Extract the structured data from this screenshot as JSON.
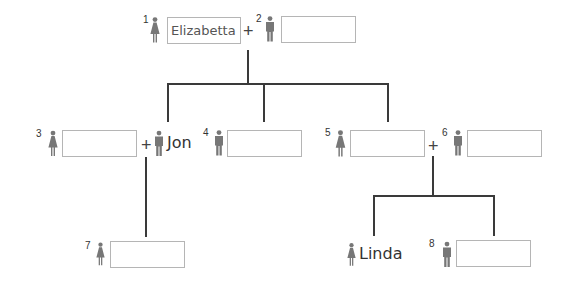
{
  "diagram": {
    "type": "family-tree",
    "connector_color": "#3a3a3a",
    "icon_color": "#777777",
    "box_border_color": "#b5b5b5"
  },
  "people": [
    {
      "id": 1,
      "number": "1",
      "gender": "female",
      "icon": "female-icon",
      "value": "Elizabetta",
      "mode": "box"
    },
    {
      "id": 2,
      "number": "2",
      "gender": "male",
      "icon": "male-icon",
      "value": "",
      "mode": "box"
    },
    {
      "id": 3,
      "number": "3",
      "gender": "female",
      "icon": "female-icon",
      "value": "",
      "mode": "box"
    },
    {
      "id": "jon",
      "number": "",
      "gender": "male",
      "icon": "male-icon",
      "value": "Jon",
      "mode": "label"
    },
    {
      "id": 4,
      "number": "4",
      "gender": "male",
      "icon": "male-icon",
      "value": "",
      "mode": "box"
    },
    {
      "id": 5,
      "number": "5",
      "gender": "female",
      "icon": "female-icon",
      "value": "",
      "mode": "box"
    },
    {
      "id": 6,
      "number": "6",
      "gender": "male",
      "icon": "male-icon",
      "value": "",
      "mode": "box"
    },
    {
      "id": 7,
      "number": "7",
      "gender": "female",
      "icon": "female-icon",
      "value": "",
      "mode": "box"
    },
    {
      "id": "linda",
      "number": "",
      "gender": "female",
      "icon": "female-icon",
      "value": "Linda",
      "mode": "label"
    },
    {
      "id": 8,
      "number": "8",
      "gender": "male",
      "icon": "male-icon",
      "value": "",
      "mode": "box"
    }
  ],
  "couples": [
    {
      "partners": [
        1,
        2
      ],
      "symbol": "+"
    },
    {
      "partners": [
        3,
        "jon"
      ],
      "symbol": "+"
    },
    {
      "partners": [
        5,
        6
      ],
      "symbol": "+"
    }
  ],
  "labels": {
    "p1_num": "1",
    "p1_value": "Elizabetta",
    "p2_num": "2",
    "p3_num": "3",
    "jon_name": "Jon",
    "p4_num": "4",
    "p5_num": "5",
    "p6_num": "6",
    "p7_num": "7",
    "linda_name": "Linda",
    "p8_num": "8",
    "plus": "+"
  }
}
